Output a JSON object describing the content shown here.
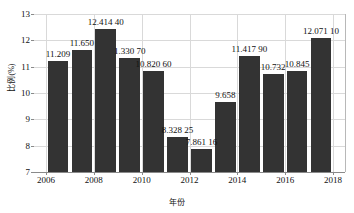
{
  "chart_data": {
    "type": "bar",
    "title": "",
    "xlabel": "年份",
    "ylabel": "比例(%)",
    "ylim": [
      7,
      13
    ],
    "yticks": [
      7,
      8,
      9,
      10,
      11,
      12,
      13
    ],
    "xlim": [
      2005.5,
      2018.5
    ],
    "xticks": [
      2006,
      2008,
      2010,
      2012,
      2014,
      2016,
      2018
    ],
    "grid": true,
    "legend": "none",
    "bar_color": "#333333",
    "categories": [
      2006,
      2007,
      2008,
      2009,
      2010,
      2011,
      2012,
      2013,
      2014,
      2015,
      2016,
      2017
    ],
    "values": [
      11.209,
      11.65,
      12.4144,
      11.3307,
      10.8206,
      8.32825,
      7.86116,
      9.658,
      11.4179,
      10.732,
      10.845,
      12.0711
    ],
    "point_labels": [
      "11.209",
      "11.650",
      "12.414 40",
      "1.330 70",
      "10.820 60",
      "8.328 25",
      "7.861 16",
      "9.658",
      "11.417 90",
      "10.732",
      "10.845",
      "12.071 10"
    ]
  }
}
